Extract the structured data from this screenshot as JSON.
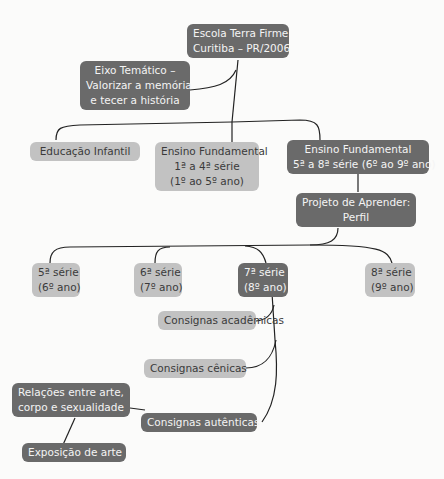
{
  "diagram": {
    "type": "mind-map",
    "colors": {
      "dark_node": "#6a6a6a",
      "light_node": "#c2c2c2",
      "dark_text": "#3a3a3a",
      "light_text": "#f4f4f4",
      "line": "#222222"
    },
    "root": {
      "line1": "Escola Terra Firme",
      "line2": "Curitiba – PR/2006"
    },
    "theme": {
      "line1": "Eixo Temático –",
      "line2": "Valorizar a memória",
      "line3": "e tecer a história"
    },
    "levels": {
      "infantil": {
        "line1": "Educação Infantil"
      },
      "fund1": {
        "line1": "Ensino Fundamental",
        "line2": "1ª a 4ª série",
        "line3": "(1º ao 5º ano)"
      },
      "fund2": {
        "line1": "Ensino Fundamental",
        "line2": "5ª a 8ª série (6º ao 9º ano)"
      }
    },
    "project": {
      "line1": "Projeto de Aprender:",
      "line2": "Perfil"
    },
    "grades": [
      {
        "line1": "5ª série",
        "line2": "(6º ano)"
      },
      {
        "line1": "6ª série",
        "line2": "(7º ano)"
      },
      {
        "line1": "7ª série",
        "line2": "(8º ano)"
      },
      {
        "line1": "8ª série",
        "line2": "(9º ano)"
      }
    ],
    "consignas": [
      {
        "label": "Consignas acadêmicas"
      },
      {
        "label": "Consignas cênicas"
      },
      {
        "label": "Consignas autênticas"
      }
    ],
    "relations": {
      "line1": "Relações entre arte,",
      "line2": "corpo e sexualidade"
    },
    "exhibition": {
      "label": "Exposição de arte"
    }
  }
}
